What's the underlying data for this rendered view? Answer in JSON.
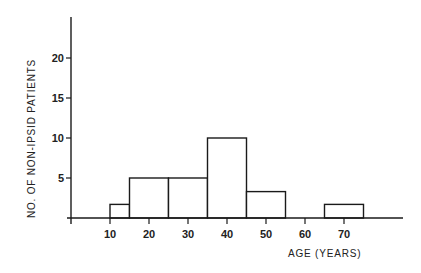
{
  "chart_data": {
    "type": "bar",
    "subtype": "histogram",
    "title": "",
    "xlabel": "AGE (YEARS)",
    "ylabel": "NO. OF NON-IPSID PATIENTS",
    "bins": [
      {
        "start": 10,
        "end": 15,
        "value": 1.7
      },
      {
        "start": 15,
        "end": 25,
        "value": 5
      },
      {
        "start": 25,
        "end": 35,
        "value": 5
      },
      {
        "start": 35,
        "end": 45,
        "value": 10
      },
      {
        "start": 45,
        "end": 55,
        "value": 3.3
      },
      {
        "start": 55,
        "end": 65,
        "value": 0
      },
      {
        "start": 65,
        "end": 75,
        "value": 1.7
      }
    ],
    "x_ticks": [
      10,
      20,
      30,
      40,
      50,
      60,
      70
    ],
    "y_ticks": [
      5,
      10,
      15,
      20
    ],
    "xlim": [
      0,
      85
    ],
    "ylim": [
      0,
      25
    ],
    "grid": false,
    "legend": null
  },
  "colors": {
    "line": "#1a1a1a",
    "bar_fill": "#ffffff",
    "background": "#ffffff"
  }
}
